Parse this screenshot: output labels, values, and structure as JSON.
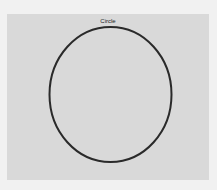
{
  "figure": {
    "title": "Circle",
    "background_color": "#f1f1f1",
    "panel_color": "#d9d9d9",
    "shape": {
      "type": "ellipse",
      "stroke_color": "#2a2a2a",
      "stroke_width": 2
    }
  }
}
